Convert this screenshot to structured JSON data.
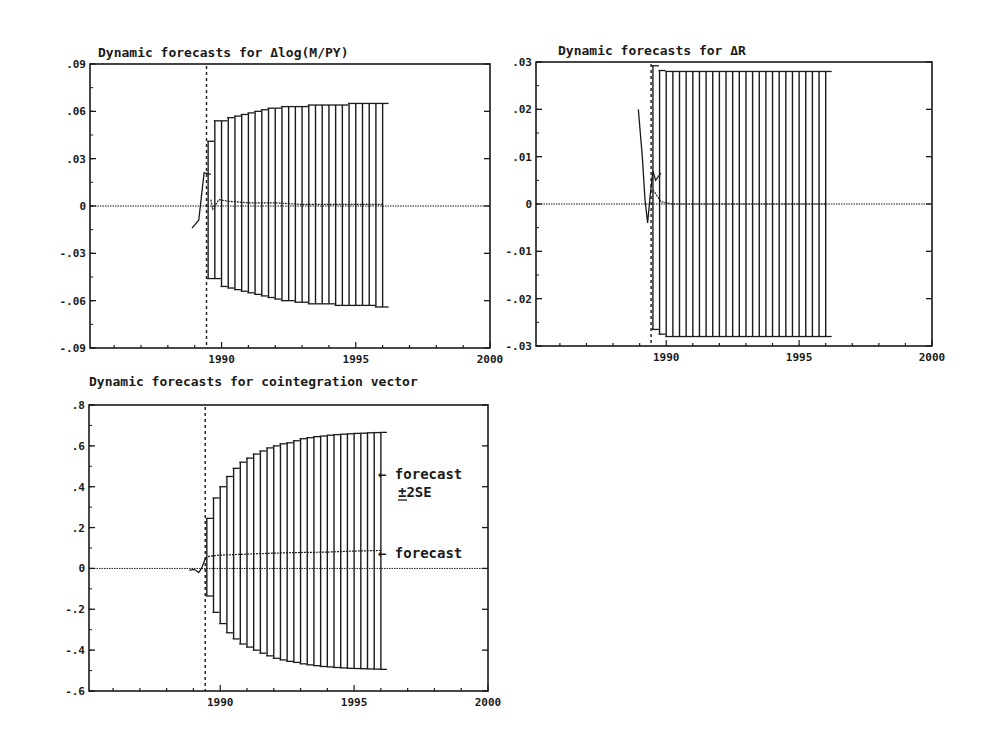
{
  "chart_data": [
    {
      "id": "dlogmpy",
      "type": "line",
      "title": "Dynamic forecasts for Δlog(M/PY)",
      "xlabel": "",
      "ylabel": "",
      "xlim": [
        1985.1,
        2000.0
      ],
      "ylim": [
        -0.09,
        0.09
      ],
      "x_ticks": [
        1990,
        1995,
        2000
      ],
      "x_minor_step": 1,
      "y_ticks": [
        {
          "v": 0.09,
          "l": ".09"
        },
        {
          "v": 0.06,
          "l": ".06"
        },
        {
          "v": 0.03,
          "l": ".03"
        },
        {
          "v": 0,
          "l": "0"
        },
        {
          "v": -0.03,
          "l": "-.03"
        },
        {
          "v": -0.06,
          "l": "-.06"
        },
        {
          "v": -0.09,
          "l": "-.09"
        }
      ],
      "y_minor_step": 0.015,
      "forecast_origin": 1989.44,
      "zero_line": true,
      "actual": {
        "x": [
          1988.9,
          1989.15,
          1989.35,
          1989.6
        ],
        "y": [
          -0.014,
          -0.009,
          0.021,
          0.02
        ]
      },
      "forecast": {
        "x": [
          1989.6,
          1989.67,
          1989.9,
          1990.25,
          1991.0,
          1992.0,
          1993.0,
          1994.0,
          1995.0,
          1996.0
        ],
        "y": [
          0.004,
          -0.002,
          0.004,
          0.003,
          0.002,
          0.002,
          0.001,
          0.001,
          0.001,
          0.001
        ]
      },
      "band_x_start": 1989.5,
      "band_x_step": 0.25,
      "band_upper": [
        0.041,
        0.054,
        0.054,
        0.056,
        0.057,
        0.058,
        0.059,
        0.06,
        0.061,
        0.062,
        0.062,
        0.063,
        0.063,
        0.063,
        0.063,
        0.064,
        0.064,
        0.064,
        0.064,
        0.064,
        0.064,
        0.065,
        0.065,
        0.065,
        0.065,
        0.065,
        0.065
      ],
      "band_lower": [
        -0.046,
        -0.046,
        -0.051,
        -0.052,
        -0.053,
        -0.054,
        -0.055,
        -0.056,
        -0.057,
        -0.058,
        -0.059,
        -0.06,
        -0.06,
        -0.061,
        -0.061,
        -0.062,
        -0.062,
        -0.062,
        -0.062,
        -0.063,
        -0.063,
        -0.063,
        -0.063,
        -0.063,
        -0.063,
        -0.064,
        -0.064
      ],
      "layout": {
        "left": 90,
        "top": 64,
        "right": 490,
        "bottom": 348,
        "title_x": 98,
        "title_y": 57
      }
    },
    {
      "id": "dr",
      "type": "line",
      "title": "Dynamic forecasts for ΔR",
      "xlabel": "",
      "ylabel": "",
      "xlim": [
        1985.1,
        2000.0
      ],
      "ylim": [
        -0.03,
        0.03
      ],
      "x_ticks": [
        1990,
        1995,
        2000
      ],
      "x_minor_step": 1,
      "y_ticks": [
        {
          "v": 0.03,
          "l": ".03"
        },
        {
          "v": 0.02,
          "l": ".02"
        },
        {
          "v": 0.01,
          "l": ".01"
        },
        {
          "v": 0,
          "l": "0"
        },
        {
          "v": -0.01,
          "l": "-.01"
        },
        {
          "v": -0.02,
          "l": "-.02"
        },
        {
          "v": -0.03,
          "l": "-.03"
        }
      ],
      "y_minor_step": 0.005,
      "forecast_origin": 1989.43,
      "zero_line": true,
      "actual": {
        "x": [
          1988.95,
          1989.1,
          1989.2,
          1989.3,
          1989.4,
          1989.5,
          1989.6,
          1989.8
        ],
        "y": [
          0.02,
          0.01,
          0.001,
          -0.004,
          0.002,
          0.007,
          0.005,
          0.0065
        ]
      },
      "forecast": {
        "x": [
          1989.5,
          1989.8,
          1990.2,
          1991.0,
          1992.0,
          1993.0,
          1994.0,
          1995.0,
          1996.0
        ],
        "y": [
          0.003,
          0.0005,
          0.0,
          0.0,
          0.0,
          0.0,
          0.0,
          0.0,
          0.0
        ]
      },
      "band_x_start": 1989.5,
      "band_x_step": 0.25,
      "band_upper": [
        0.0292,
        0.0282,
        0.028,
        0.028,
        0.028,
        0.028,
        0.028,
        0.028,
        0.028,
        0.028,
        0.028,
        0.028,
        0.028,
        0.028,
        0.028,
        0.028,
        0.028,
        0.028,
        0.028,
        0.028,
        0.028,
        0.028,
        0.028,
        0.028,
        0.028,
        0.028,
        0.028
      ],
      "band_lower": [
        -0.0265,
        -0.0275,
        -0.028,
        -0.028,
        -0.028,
        -0.028,
        -0.028,
        -0.028,
        -0.028,
        -0.028,
        -0.028,
        -0.028,
        -0.028,
        -0.028,
        -0.028,
        -0.028,
        -0.028,
        -0.028,
        -0.028,
        -0.028,
        -0.028,
        -0.028,
        -0.028,
        -0.028,
        -0.028,
        -0.028,
        -0.028
      ],
      "layout": {
        "left": 536,
        "top": 62,
        "right": 932,
        "bottom": 346,
        "title_x": 558,
        "title_y": 55
      }
    },
    {
      "id": "coint",
      "type": "line",
      "title": "Dynamic forecasts for cointegration vector",
      "xlabel": "",
      "ylabel": "",
      "xlim": [
        1985.1,
        2000.0
      ],
      "ylim": [
        -0.6,
        0.8
      ],
      "x_ticks": [
        1990,
        1995,
        2000
      ],
      "x_minor_step": 1,
      "y_ticks": [
        {
          "v": 0.8,
          "l": ".8"
        },
        {
          "v": 0.6,
          "l": ".6"
        },
        {
          "v": 0.4,
          "l": ".4"
        },
        {
          "v": 0.2,
          "l": ".2"
        },
        {
          "v": 0,
          "l": "0"
        },
        {
          "v": -0.2,
          "l": "-.2"
        },
        {
          "v": -0.4,
          "l": "-.4"
        },
        {
          "v": -0.6,
          "l": "-.6"
        }
      ],
      "y_minor_step": 0.1,
      "forecast_origin": 1989.44,
      "zero_line": true,
      "actual": {
        "x": [
          1988.85,
          1989.0,
          1989.1,
          1989.2,
          1989.3,
          1989.45
        ],
        "y": [
          -0.01,
          -0.005,
          -0.01,
          -0.02,
          0.0,
          0.05
        ]
      },
      "forecast": {
        "x": [
          1989.45,
          1989.6,
          1990.0,
          1991.0,
          1992.0,
          1993.0,
          1994.0,
          1995.0,
          1996.0
        ],
        "y": [
          0.05,
          0.06,
          0.065,
          0.07,
          0.075,
          0.078,
          0.08,
          0.085,
          0.088
        ]
      },
      "band_x_start": 1989.5,
      "band_x_step": 0.25,
      "band_upper": [
        0.245,
        0.345,
        0.4,
        0.45,
        0.49,
        0.52,
        0.54,
        0.56,
        0.575,
        0.59,
        0.6,
        0.61,
        0.615,
        0.625,
        0.635,
        0.64,
        0.645,
        0.648,
        0.652,
        0.655,
        0.657,
        0.659,
        0.661,
        0.662,
        0.664,
        0.665,
        0.666
      ],
      "band_lower": [
        -0.135,
        -0.215,
        -0.27,
        -0.315,
        -0.345,
        -0.37,
        -0.385,
        -0.4,
        -0.415,
        -0.428,
        -0.44,
        -0.448,
        -0.455,
        -0.46,
        -0.467,
        -0.472,
        -0.476,
        -0.48,
        -0.482,
        -0.485,
        -0.487,
        -0.489,
        -0.49,
        -0.491,
        -0.492,
        -0.493,
        -0.494
      ],
      "layout": {
        "left": 89,
        "top": 405,
        "right": 488,
        "bottom": 691,
        "title_x": 89,
        "title_y": 386
      },
      "annotations": [
        {
          "text": "← forecast",
          "x": 378,
          "y": 479
        },
        {
          "text": "±2SE",
          "x": 398,
          "y": 497,
          "underline_pm": true
        },
        {
          "text": "← forecast",
          "x": 378,
          "y": 558
        }
      ]
    }
  ],
  "colors": {
    "ink": "#1a1a1a",
    "background": "#ffffff"
  }
}
